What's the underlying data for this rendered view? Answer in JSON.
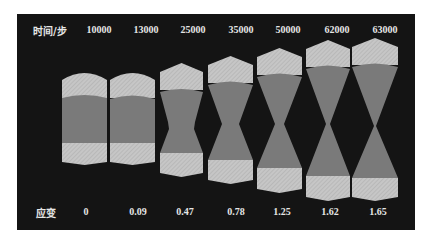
{
  "figure": {
    "time_axis_label": "时间/步",
    "strain_axis_label": "应变",
    "colors": {
      "background": "#141414",
      "cap": "#c4c4c4",
      "body": "#7a7a7a",
      "text": "#e6e6e6"
    },
    "specimens": [
      {
        "time": "10000",
        "strain": "0"
      },
      {
        "time": "13000",
        "strain": "0.09"
      },
      {
        "time": "25000",
        "strain": "0.47"
      },
      {
        "time": "35000",
        "strain": "0.78"
      },
      {
        "time": "50000",
        "strain": "1.25"
      },
      {
        "time": "62000",
        "strain": "1.62"
      },
      {
        "time": "63000",
        "strain": "1.65"
      }
    ]
  }
}
